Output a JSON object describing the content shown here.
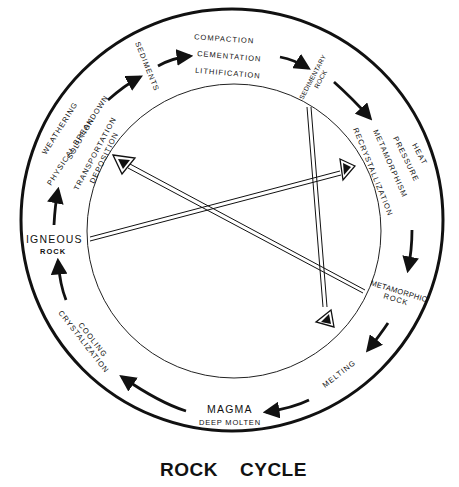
{
  "title": {
    "word1": "ROCK",
    "word2": "CYCLE"
  },
  "nodes": {
    "sediments": "SEDIMENTS",
    "sedimentary_rock": {
      "line1": "SEDIMENTARY",
      "line2": "ROCK"
    },
    "metamorphic_rock": {
      "line1": "METAMORPHIC",
      "line2": "ROCK"
    },
    "magma": {
      "line1": "MAGMA",
      "line2": "DEEP MOLTEN"
    },
    "igneous_rock": {
      "line1": "IGNEOUS",
      "line2": "ROCK"
    }
  },
  "processes": {
    "sediments_to_sedimentary": [
      "COMPACTION",
      "CEMENTATION",
      "LITHIFICATION"
    ],
    "sedimentary_to_metamorphic": [
      "HEAT",
      "PRESSURE",
      "METAMORPHISM",
      "RECRYSTALLIZATION"
    ],
    "metamorphic_to_magma": [
      "MELTING"
    ],
    "magma_to_igneous": [
      "COOLING",
      "CRYSTALIZATION"
    ],
    "igneous_to_sediments": [
      "WEATHERING",
      "PHYSICAL BREAKDOWN",
      "SOLUTION",
      "TRANSPORTATION",
      "DEPOSITION"
    ]
  },
  "shortcuts": [
    {
      "from": "igneous_rock",
      "to": "metamorphic_rock_side",
      "description": "Igneous to heat/pressure (metamorphism)"
    },
    {
      "from": "metamorphic_rock",
      "to": "sediments_side",
      "description": "Metamorphic to weathering (sediments)"
    },
    {
      "from": "sedimentary_rock",
      "to": "melting_side",
      "description": "Sedimentary to melting (magma)"
    }
  ],
  "colors": {
    "ink": "#111111",
    "background": "#ffffff"
  }
}
